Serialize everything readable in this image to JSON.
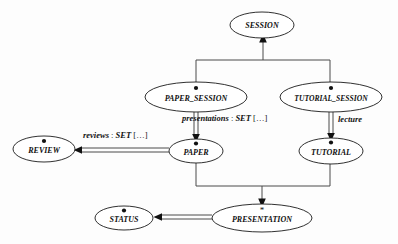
{
  "diagram": {
    "type": "entity-relationship-ellipse-graph",
    "background_color": "#fdfdfd",
    "line_color": "#4a4a4a",
    "text_color": "#111111",
    "nodes": [
      {
        "id": "session",
        "label": "SESSION",
        "cx": 262,
        "cy": 25,
        "rx": 32,
        "ry": 13,
        "marker": "none"
      },
      {
        "id": "paper_session",
        "label": "PAPER_SESSION",
        "cx": 196,
        "cy": 97,
        "rx": 51,
        "ry": 15,
        "marker": "dot"
      },
      {
        "id": "tutorial_session",
        "label": "TUTORIAL_SESSION",
        "cx": 331,
        "cy": 97,
        "rx": 51,
        "ry": 15,
        "marker": "dot"
      },
      {
        "id": "review",
        "label": "REVIEW",
        "cx": 44,
        "cy": 149,
        "rx": 31,
        "ry": 13,
        "marker": "dot"
      },
      {
        "id": "paper",
        "label": "PAPER",
        "cx": 196,
        "cy": 151,
        "rx": 27,
        "ry": 12,
        "marker": "dot"
      },
      {
        "id": "tutorial",
        "label": "TUTORIAL",
        "cx": 331,
        "cy": 151,
        "rx": 32,
        "ry": 13,
        "marker": "dot"
      },
      {
        "id": "status",
        "label": "STATUS",
        "cx": 124,
        "cy": 218,
        "rx": 29,
        "ry": 12,
        "marker": "dot"
      },
      {
        "id": "presentation",
        "label": "PRESENTATION",
        "cx": 262,
        "cy": 218,
        "rx": 50,
        "ry": 14,
        "marker": "star"
      }
    ],
    "markers": {
      "dot": "filled-circle",
      "star": "*"
    },
    "edges": [
      {
        "id": "paper-session-to-session",
        "from": "paper_session",
        "to": "session",
        "style": "single",
        "arrow": "up"
      },
      {
        "id": "tutorial-session-to-session",
        "from": "tutorial_session",
        "to": "session",
        "style": "single",
        "arrow": "up"
      },
      {
        "id": "paper-session-to-paper",
        "from": "paper_session",
        "to": "paper",
        "style": "double",
        "arrow": "down",
        "label": "presentations_label"
      },
      {
        "id": "tutorial-session-to-tutorial",
        "from": "tutorial_session",
        "to": "tutorial",
        "style": "double",
        "arrow": "down",
        "label": "lecture_label"
      },
      {
        "id": "paper-to-review",
        "from": "paper",
        "to": "review",
        "style": "double",
        "arrow": "left",
        "label": "reviews_label"
      },
      {
        "id": "paper-to-presentation",
        "from": "paper",
        "to": "presentation",
        "style": "single",
        "arrow": "down"
      },
      {
        "id": "tutorial-to-presentation",
        "from": "tutorial",
        "to": "presentation",
        "style": "single",
        "arrow": "down"
      },
      {
        "id": "presentation-to-status",
        "from": "presentation",
        "to": "status",
        "style": "double",
        "arrow": "left"
      }
    ],
    "edge_labels": {
      "presentations_label": {
        "role": "presentations",
        "colon": " : ",
        "type": "SET",
        "brackets": " […]",
        "x": 182,
        "y": 114
      },
      "lecture_label": {
        "role": "lecture",
        "colon": "",
        "type": "",
        "brackets": "",
        "x": 338,
        "y": 115
      },
      "reviews_label": {
        "role": "reviews",
        "colon": " : ",
        "type": "SET",
        "brackets": " […]",
        "x": 83,
        "y": 131
      }
    }
  }
}
